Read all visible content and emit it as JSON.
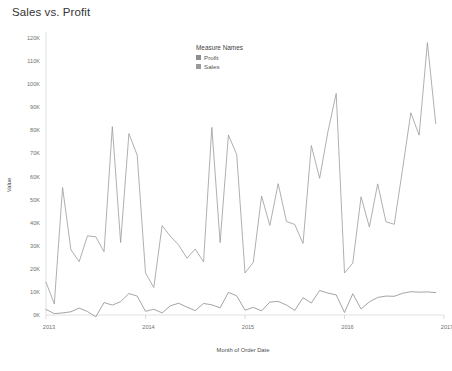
{
  "title": "Sales vs. Profit",
  "legend": {
    "title": "Measure Names",
    "items": [
      {
        "label": "Profit",
        "color": "#8d8d8d"
      },
      {
        "label": "Sales",
        "color": "#9a9a9a"
      }
    ]
  },
  "axes": {
    "y_title": "Value",
    "x_title": "Month of Order Date",
    "y_ticks": [
      "0K",
      "10K",
      "20K",
      "30K",
      "40K",
      "50K",
      "60K",
      "70K",
      "80K",
      "90K",
      "100K",
      "110K",
      "120K"
    ],
    "x_ticks": [
      "2013",
      "2014",
      "2015",
      "2016",
      "2017"
    ]
  },
  "chart_data": {
    "type": "line",
    "title": "Sales vs. Profit",
    "xlabel": "Month of Order Date",
    "ylabel": "Value",
    "ylim": [
      0,
      120000
    ],
    "xlim": [
      "2013-01",
      "2017-01"
    ],
    "grid": false,
    "legend_position": "inside-top-center",
    "legend_title": "Measure Names",
    "x": [
      "2013-01",
      "2013-02",
      "2013-03",
      "2013-04",
      "2013-05",
      "2013-06",
      "2013-07",
      "2013-08",
      "2013-09",
      "2013-10",
      "2013-11",
      "2013-12",
      "2014-01",
      "2014-02",
      "2014-03",
      "2014-04",
      "2014-05",
      "2014-06",
      "2014-07",
      "2014-08",
      "2014-09",
      "2014-10",
      "2014-11",
      "2014-12",
      "2015-01",
      "2015-02",
      "2015-03",
      "2015-04",
      "2015-05",
      "2015-06",
      "2015-07",
      "2015-08",
      "2015-09",
      "2015-10",
      "2015-11",
      "2015-12",
      "2016-01",
      "2016-02",
      "2016-03",
      "2016-04",
      "2016-05",
      "2016-06",
      "2016-07",
      "2016-08",
      "2016-09",
      "2016-10",
      "2016-11",
      "2016-12"
    ],
    "x_tick_labels": [
      "2013",
      "2014",
      "2015",
      "2016",
      "2017"
    ],
    "x_tick_index": [
      0,
      12,
      24,
      36,
      48
    ],
    "y_ticks": [
      0,
      10000,
      20000,
      30000,
      40000,
      50000,
      60000,
      70000,
      80000,
      90000,
      100000,
      110000,
      120000
    ],
    "y_tick_labels": [
      "0K",
      "10K",
      "20K",
      "30K",
      "40K",
      "50K",
      "60K",
      "70K",
      "80K",
      "90K",
      "100K",
      "110K",
      "120K"
    ],
    "series": [
      {
        "name": "Sales",
        "color": "#9a9a9a",
        "values": [
          14200,
          4800,
          55200,
          28300,
          23100,
          34300,
          33900,
          27400,
          81600,
          31400,
          78600,
          69200,
          18200,
          11900,
          38700,
          34100,
          30300,
          24600,
          28600,
          23000,
          81300,
          31400,
          78000,
          69500,
          18200,
          22800,
          51500,
          38800,
          56900,
          40500,
          39200,
          31000,
          73400,
          59200,
          79400,
          96000,
          18200,
          22500,
          51200,
          38100,
          56800,
          40400,
          39300,
          63100,
          87600,
          77900,
          118000,
          83000
        ]
      },
      {
        "name": "Profit",
        "color": "#8d8d8d",
        "values": [
          2400,
          600,
          900,
          1400,
          3000,
          1500,
          -800,
          5400,
          4300,
          5800,
          9300,
          8200,
          1600,
          2500,
          900,
          4000,
          5100,
          3400,
          1900,
          5000,
          4400,
          3100,
          9800,
          8300,
          2100,
          3300,
          1800,
          5600,
          5900,
          4300,
          2000,
          7500,
          5200,
          10600,
          9500,
          8700,
          1100,
          9200,
          2600,
          5700,
          7600,
          8200,
          8100,
          9400,
          10100,
          9900,
          10000,
          9700
        ]
      }
    ]
  }
}
